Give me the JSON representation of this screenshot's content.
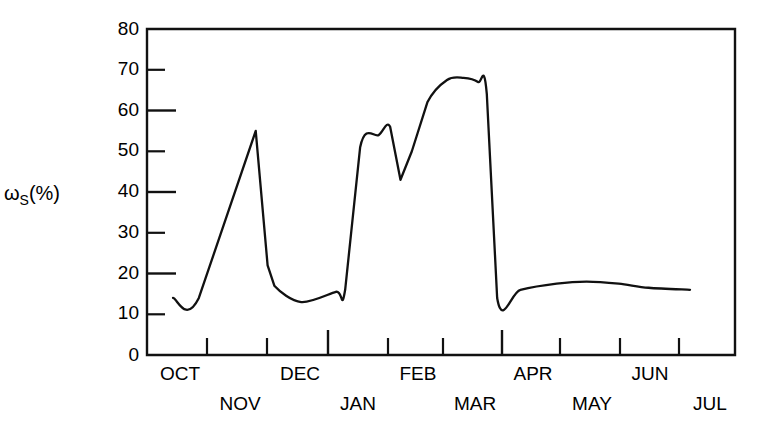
{
  "chart_data": {
    "type": "line",
    "title": "",
    "subtitle": "",
    "xlabel": "",
    "ylabel": "ωS(%)",
    "ylabel_main": "ω",
    "ylabel_subscript": "S",
    "ylabel_suffix": "(%)",
    "ylim": [
      0,
      80
    ],
    "ytick_values": [
      0,
      10,
      20,
      30,
      40,
      50,
      60,
      70,
      80
    ],
    "ytick_labels": [
      "0",
      "10",
      "20",
      "30",
      "40",
      "50",
      "60",
      "70",
      "80"
    ],
    "grid": false,
    "legend": "none",
    "line_color": "#111111",
    "axis_color": "#111111",
    "background_color": "#ffffff",
    "x_axis_type": "month",
    "categories": [
      "OCT",
      "NOV",
      "DEC",
      "JAN",
      "FEB",
      "MAR",
      "APR",
      "MAY",
      "JUN",
      "JUL"
    ],
    "xtick_label_rows": [
      {
        "row": "upper",
        "labels": [
          "OCT",
          "DEC",
          "FEB",
          "APR",
          "JUN"
        ]
      },
      {
        "row": "lower",
        "labels": [
          "NOV",
          "JAN",
          "MAR",
          "MAY",
          "JUL"
        ]
      }
    ],
    "series": [
      {
        "name": "ωS",
        "x": [
          "OCT-15",
          "NOV-01",
          "NOV-12",
          "NOV-18",
          "NOV-22",
          "DEC-05",
          "DEC-22",
          "JAN-05",
          "JAN-12",
          "JAN-20",
          "JAN-26",
          "FEB-02",
          "FEB-08",
          "FEB-16",
          "FEB-26",
          "MAR-08",
          "MAR-18",
          "MAR-24",
          "APR-02",
          "APR-20",
          "MAY-10",
          "MAY-28",
          "JUN-14",
          "JUN-26",
          "JUL-05"
        ],
        "values": [
          14,
          14,
          55,
          22,
          17,
          13,
          15.5,
          16,
          51,
          54,
          56,
          43,
          50,
          62,
          67.5,
          68,
          67,
          64,
          14,
          16,
          17.5,
          18,
          17.5,
          16.5,
          16
        ]
      }
    ],
    "annotations": [
      {
        "text": "peak",
        "value": 55,
        "month": "NOV"
      },
      {
        "text": "trough",
        "value": 13,
        "month": "DEC"
      },
      {
        "text": "plateau",
        "value": 68,
        "month": "MAR"
      }
    ]
  }
}
